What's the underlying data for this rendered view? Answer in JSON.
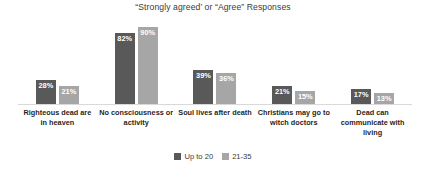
{
  "chart_data": {
    "type": "bar",
    "title": "“Strongly agreed’ or “Agree” Responses",
    "xlabel": "",
    "ylabel": "",
    "ylim": [
      0,
      100
    ],
    "grid": false,
    "legend_position": "bottom",
    "value_suffix": "%",
    "categories": [
      "Righteous dead are in heaven",
      "No consciousness or activity",
      "Soul lives after death",
      "Christians may go to witch doctors",
      "Dead can communicate with living"
    ],
    "series": [
      {
        "name": "Up to 20",
        "color": "#595959",
        "values": [
          28,
          82,
          39,
          21,
          17
        ],
        "labels": [
          "28%",
          "82%",
          "39%",
          "21%",
          "17%"
        ]
      },
      {
        "name": "21-35",
        "color": "#a6a6a6",
        "values": [
          21,
          90,
          36,
          15,
          13
        ],
        "labels": [
          "21%",
          "90%",
          "36%",
          "15%",
          "13%"
        ]
      }
    ]
  },
  "colors": {
    "series_1": "#595959",
    "series_2": "#a6a6a6",
    "axis_line": "#d9d9d9",
    "title_text": "#3a3a3a",
    "category_text": "#1f1f1f",
    "value_text": "#ffffff",
    "background": "#ffffff"
  }
}
